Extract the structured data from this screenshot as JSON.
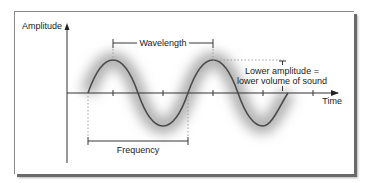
{
  "diagram": {
    "axes": {
      "y_label": "Amplitude",
      "x_label": "Time"
    },
    "annotations": {
      "wavelength": "Wavelength",
      "frequency": "Frequency",
      "amplitude_note_line1": "Lower amplitude =",
      "amplitude_note_line2": "lower volume of sound"
    },
    "colors": {
      "wave": "#4a4a4a",
      "glow": "#9a9a9a",
      "axis": "#333333",
      "frame_shadow": "#6a6a6a"
    },
    "wave": {
      "type": "sine",
      "cycles_shown": 2,
      "note": "second cycle ends at reduced amplitude near axis"
    }
  }
}
